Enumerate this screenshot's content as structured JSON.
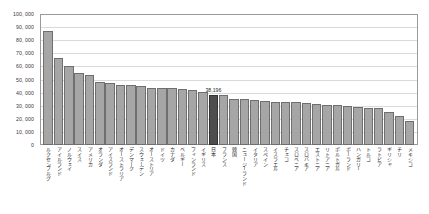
{
  "chart_data": {
    "type": "bar",
    "title": "",
    "xlabel": "",
    "ylabel": "",
    "ylim": [
      0,
      100000
    ],
    "grid": true,
    "legend": null,
    "highlight_category": "日本",
    "highlight_label": "38,196",
    "ytick_labels": [
      "100, 000",
      "90, 000",
      "80, 000",
      "70, 000",
      "60, 000",
      "50, 000",
      "40, 000",
      "30, 000",
      "20, 000",
      "10, 000",
      "0"
    ],
    "ytick_values": [
      100000,
      90000,
      80000,
      70000,
      60000,
      50000,
      40000,
      30000,
      20000,
      10000,
      0
    ],
    "categories": [
      "ルクセンブルグ",
      "アイルランド",
      "ノルウェイ",
      "スイス",
      "アメリカ",
      "オランダ",
      "アイスランド",
      "オーストラリア",
      "デンマーク",
      "スウェーデン",
      "オーストリア",
      "ドイツ",
      "カナダ",
      "ベルギー",
      "フィンランド",
      "イギリス",
      "日本",
      "フランス",
      "韓国",
      "ニュージーランド",
      "イタリア",
      "スペイン",
      "イスラエル",
      "チェコ",
      "スロベニア",
      "スロバキア",
      "エストニア",
      "リトアニア",
      "ポルトガル",
      "ポーランド",
      "ハンガリー",
      "トルコ",
      "ラトビア",
      "ギリシャ",
      "チリ",
      "メキシコ"
    ],
    "values": [
      87000,
      66500,
      60500,
      55000,
      53500,
      48000,
      47000,
      46000,
      45800,
      44800,
      43800,
      43500,
      43200,
      42800,
      42000,
      40500,
      38196,
      38000,
      35500,
      35000,
      34500,
      33800,
      33200,
      32800,
      32500,
      31800,
      31500,
      30800,
      30200,
      29800,
      29200,
      28500,
      28000,
      25000,
      22500,
      18000
    ]
  }
}
